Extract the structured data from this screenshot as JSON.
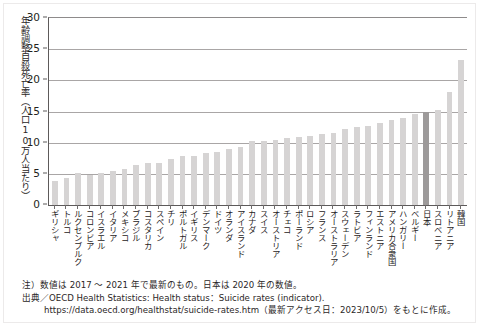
{
  "figure": {
    "y_axis_title": "年齢調整自殺死亡率（人口10万人当たり）",
    "notes": {
      "note_label": "注）",
      "note_text": "数値は 2017 ～ 2021 年で最新のもの。日本は 2020 年の数値。",
      "source_label": "出典／",
      "source_text": "OECD Health Statistics: Health status：Suicide rates (indicator).",
      "source_url": "https://data.oecd.org/healthstat/suicide-rates.htm",
      "source_access": "（最新アクセス日：2023/10/5）をもとに作成。"
    }
  },
  "chart_data": {
    "type": "bar",
    "title": "",
    "xlabel": "",
    "ylabel": "年齢調整自殺死亡率（人口10万人当たり）",
    "ylim": [
      0,
      30
    ],
    "yticks": [
      0,
      5,
      10,
      15,
      20,
      25,
      30
    ],
    "grid": true,
    "legend": null,
    "highlight_category": "日本",
    "highlight_color": "#9d9a9a",
    "bar_color": "#d6d4d4",
    "categories": [
      "ギリシャ",
      "トルコ",
      "ルクセンブルク",
      "コロンビア",
      "イスラエル",
      "イタリア",
      "メキシコ",
      "ブラジル",
      "コスタリカ",
      "スペイン",
      "チリ",
      "ポルトガル",
      "イギリス",
      "デンマーク",
      "ドイツ",
      "オランダ",
      "アイスランド",
      "カナダ",
      "スイス",
      "オーストリア",
      "チェコ",
      "ポーランド",
      "ロシア",
      "フランス",
      "オーストラリア",
      "スウェーデン",
      "ラトビア",
      "フィンランド",
      "エストニア",
      "アメリカ合衆国",
      "ハンガリー",
      "ベルギー",
      "日本",
      "スロベニア",
      "リトアニア",
      "韓国"
    ],
    "values": [
      3.8,
      4.4,
      5.1,
      4.8,
      5.2,
      5.4,
      5.7,
      6.4,
      6.7,
      6.8,
      7.4,
      7.9,
      7.9,
      8.4,
      8.5,
      9.0,
      9.3,
      10.2,
      10.3,
      10.5,
      10.7,
      10.9,
      11.1,
      11.4,
      11.6,
      12.2,
      12.5,
      12.7,
      13.2,
      13.6,
      14.0,
      14.6,
      15.0,
      15.2,
      18.1,
      23.3
    ]
  }
}
